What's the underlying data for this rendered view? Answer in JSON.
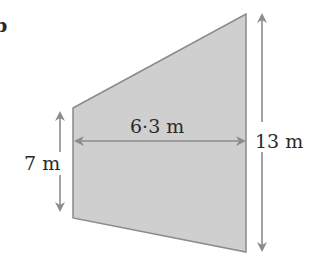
{
  "figure": {
    "part_label": "b",
    "shape": "trapezium",
    "colors": {
      "fill": "#cfcfcf",
      "outline": "#8a8a8a",
      "arrow": "#8c8c8c",
      "text": "#2a2a2a"
    },
    "dimensions": {
      "left_side": "7 m",
      "width": "6·3 m",
      "right_side": "13 m"
    }
  }
}
